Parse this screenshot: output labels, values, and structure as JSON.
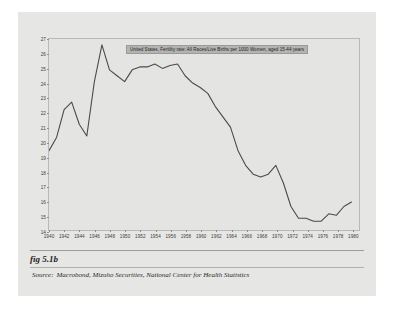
{
  "figure": {
    "caption": "fig 5.1b",
    "source_label": "Source:",
    "source_text": "Macrobond, Mizuho Securities, National Center for Health Statistics"
  },
  "colors": {
    "page_background": "#e6e6e4",
    "plot_background": "#e4e4e2",
    "line_color": "#4a4a4a",
    "frame_color": "#b9b9b7",
    "legend_background": "#b4b4b2"
  },
  "chart_data": {
    "type": "line",
    "title": "",
    "legend": [
      "United States, Fertility rate: All Races/Live Births per 1000 Women, aged 15-44 years"
    ],
    "legend_position": "top-center-inside",
    "grid": false,
    "xlabel": "",
    "ylabel": "",
    "xlim": [
      1940,
      1981
    ],
    "ylim": [
      14,
      27
    ],
    "ytick_labels": [
      "27",
      "26",
      "25",
      "24",
      "23",
      "22",
      "21",
      "20",
      "19",
      "18",
      "17",
      "16",
      "15",
      "14"
    ],
    "yticks": [
      27,
      26,
      25,
      24,
      23,
      22,
      21,
      20,
      19,
      18,
      17,
      16,
      15,
      14
    ],
    "xtick_labels": [
      "1940",
      "1942",
      "1944",
      "1946",
      "1948",
      "1950",
      "1952",
      "1954",
      "1956",
      "1958",
      "1960",
      "1962",
      "1964",
      "1966",
      "1968",
      "1970",
      "1972",
      "1974",
      "1976",
      "1978",
      "1980"
    ],
    "xticks": [
      1940,
      1942,
      1944,
      1946,
      1948,
      1950,
      1952,
      1954,
      1956,
      1958,
      1960,
      1962,
      1964,
      1966,
      1968,
      1970,
      1972,
      1974,
      1976,
      1978,
      1980
    ],
    "series": [
      {
        "name": "United States, Fertility rate: All Races/Live Births per 1000 Women, aged 15-44 years",
        "x": [
          1940,
          1941,
          1942,
          1943,
          1944,
          1945,
          1946,
          1947,
          1948,
          1949,
          1950,
          1951,
          1952,
          1953,
          1954,
          1955,
          1956,
          1957,
          1958,
          1959,
          1960,
          1961,
          1962,
          1963,
          1964,
          1965,
          1966,
          1967,
          1968,
          1969,
          1970,
          1971,
          1972,
          1973,
          1974,
          1975,
          1976,
          1977,
          1978,
          1979,
          1980
        ],
        "values": [
          19.4,
          20.3,
          22.2,
          22.7,
          21.2,
          20.4,
          24.1,
          26.6,
          24.9,
          24.5,
          24.1,
          24.9,
          25.1,
          25.1,
          25.3,
          25.0,
          25.2,
          25.3,
          24.5,
          24.0,
          23.7,
          23.3,
          22.4,
          21.7,
          21.0,
          19.4,
          18.4,
          17.8,
          17.6,
          17.8,
          18.4,
          17.2,
          15.6,
          14.8,
          14.8,
          14.6,
          14.6,
          15.1,
          15.0,
          15.6,
          15.9
        ]
      }
    ]
  }
}
